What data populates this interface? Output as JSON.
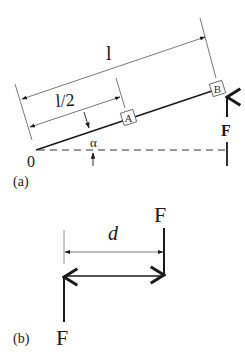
{
  "figure_a": {
    "label": "(a)",
    "length_label": "l",
    "half_length_label": "l/2",
    "point_a": "A",
    "point_b": "B",
    "origin_label": "0",
    "angle_label": "α",
    "force_label": "F"
  },
  "figure_b": {
    "label": "(b)",
    "distance_label": "d",
    "force_top_label": "F",
    "force_bottom_label": "F"
  },
  "colors": {
    "ink": "#1a1a1a",
    "thin_line": "#555555",
    "background": "#ffffff"
  }
}
